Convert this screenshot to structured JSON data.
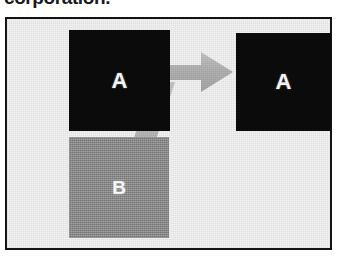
{
  "caption": {
    "clipped_line": "corporation."
  },
  "figure": {
    "frame_border_color": "#141414",
    "background_color": "#f3f3f3"
  },
  "diagram": {
    "type": "merger-flow",
    "nodes": [
      {
        "id": "source-a",
        "label": "A",
        "role": "source",
        "fill": "#0b0b0b",
        "label_color": "#fdfdfd",
        "position": {
          "x": 62,
          "y": 11,
          "width": 101,
          "height": 101
        }
      },
      {
        "id": "source-b",
        "label": "B",
        "role": "source",
        "fill": "#8e8e8e",
        "label_color": "#ffffff",
        "position": {
          "x": 62,
          "y": 118,
          "width": 100,
          "height": 101
        }
      },
      {
        "id": "result-a",
        "label": "A",
        "role": "result",
        "fill": "#0b0b0b",
        "label_color": "#fdfdfd",
        "position": {
          "x": 229,
          "y": 14,
          "width": 95,
          "height": 98
        }
      }
    ],
    "arrow": {
      "fill": "#b4b4b4",
      "direction": "right",
      "from": [
        "source-a",
        "source-b"
      ],
      "to": "result-a",
      "style": "merging-block-arrow"
    }
  }
}
